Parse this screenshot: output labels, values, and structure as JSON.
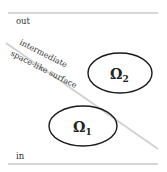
{
  "labels": {
    "out": "out",
    "in": "in",
    "surface_line1": "intermediate",
    "surface_line2": "space-like surface"
  },
  "regions": [
    {
      "name": "Omega 2",
      "symbol": "Ω",
      "subscript": "2"
    },
    {
      "name": "Omega 1",
      "symbol": "Ω",
      "subscript": "1"
    }
  ],
  "colors": {
    "boundary_line": "#c8c8c8",
    "surface_line": "#cfcfcf",
    "ellipse_stroke": "#1a1a1a",
    "text": "#333333"
  }
}
